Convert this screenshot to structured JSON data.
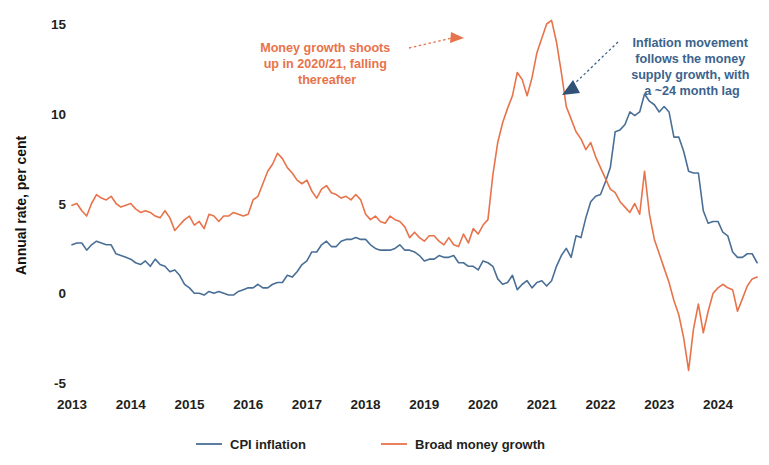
{
  "chart_data": {
    "type": "line",
    "title": "",
    "xlabel": "",
    "ylabel": "Annual rate, per cent",
    "ylim": [
      -5,
      15
    ],
    "xlim": [
      2013.0,
      2024.75
    ],
    "yticks": [
      -5,
      0,
      5,
      10,
      15
    ],
    "ytick_labels": [
      "-5",
      "0",
      "5",
      "10",
      "15"
    ],
    "xticks": [
      2013,
      2014,
      2015,
      2016,
      2017,
      2018,
      2019,
      2020,
      2021,
      2022,
      2023,
      2024
    ],
    "xtick_labels": [
      "2013",
      "2014",
      "2015",
      "2016",
      "2017",
      "2018",
      "2019",
      "2020",
      "2021",
      "2022",
      "2023",
      "2024"
    ],
    "grid": false,
    "legend_position": "bottom",
    "series": [
      {
        "name": "CPI inflation",
        "color": "#4a6f96",
        "x": [
          2013.0,
          2013.083,
          2013.167,
          2013.25,
          2013.333,
          2013.417,
          2013.5,
          2013.583,
          2013.667,
          2013.75,
          2013.833,
          2013.917,
          2014.0,
          2014.083,
          2014.167,
          2014.25,
          2014.333,
          2014.417,
          2014.5,
          2014.583,
          2014.667,
          2014.75,
          2014.833,
          2014.917,
          2015.0,
          2015.083,
          2015.167,
          2015.25,
          2015.333,
          2015.417,
          2015.5,
          2015.583,
          2015.667,
          2015.75,
          2015.833,
          2015.917,
          2016.0,
          2016.083,
          2016.167,
          2016.25,
          2016.333,
          2016.417,
          2016.5,
          2016.583,
          2016.667,
          2016.75,
          2016.833,
          2016.917,
          2017.0,
          2017.083,
          2017.167,
          2017.25,
          2017.333,
          2017.417,
          2017.5,
          2017.583,
          2017.667,
          2017.75,
          2017.833,
          2017.917,
          2018.0,
          2018.083,
          2018.167,
          2018.25,
          2018.333,
          2018.417,
          2018.5,
          2018.583,
          2018.667,
          2018.75,
          2018.833,
          2018.917,
          2019.0,
          2019.083,
          2019.167,
          2019.25,
          2019.333,
          2019.417,
          2019.5,
          2019.583,
          2019.667,
          2019.75,
          2019.833,
          2019.917,
          2020.0,
          2020.083,
          2020.167,
          2020.25,
          2020.333,
          2020.417,
          2020.5,
          2020.583,
          2020.667,
          2020.75,
          2020.833,
          2020.917,
          2021.0,
          2021.083,
          2021.167,
          2021.25,
          2021.333,
          2021.417,
          2021.5,
          2021.583,
          2021.667,
          2021.75,
          2021.833,
          2021.917,
          2022.0,
          2022.083,
          2022.167,
          2022.25,
          2022.333,
          2022.417,
          2022.5,
          2022.583,
          2022.667,
          2022.75,
          2022.833,
          2022.917,
          2023.0,
          2023.083,
          2023.167,
          2023.25,
          2023.333,
          2023.417,
          2023.5,
          2023.583,
          2023.667,
          2023.75,
          2023.833,
          2023.917,
          2024.0,
          2024.083,
          2024.167,
          2024.25,
          2024.333,
          2024.417,
          2024.5,
          2024.583,
          2024.667
        ],
        "values": [
          2.7,
          2.8,
          2.8,
          2.4,
          2.7,
          2.9,
          2.8,
          2.7,
          2.7,
          2.2,
          2.1,
          2.0,
          1.9,
          1.7,
          1.6,
          1.8,
          1.5,
          1.9,
          1.6,
          1.5,
          1.2,
          1.3,
          1.0,
          0.5,
          0.3,
          0.0,
          0.0,
          -0.1,
          0.1,
          0.0,
          0.1,
          0.0,
          -0.1,
          -0.1,
          0.1,
          0.2,
          0.3,
          0.3,
          0.5,
          0.3,
          0.3,
          0.5,
          0.6,
          0.6,
          1.0,
          0.9,
          1.2,
          1.6,
          1.8,
          2.3,
          2.3,
          2.7,
          2.9,
          2.6,
          2.6,
          2.9,
          3.0,
          3.0,
          3.1,
          3.0,
          3.0,
          2.7,
          2.5,
          2.4,
          2.4,
          2.4,
          2.5,
          2.7,
          2.4,
          2.4,
          2.3,
          2.1,
          1.8,
          1.9,
          1.9,
          2.1,
          2.0,
          2.0,
          2.1,
          1.7,
          1.7,
          1.5,
          1.5,
          1.3,
          1.8,
          1.7,
          1.5,
          0.8,
          0.5,
          0.6,
          1.0,
          0.2,
          0.5,
          0.7,
          0.3,
          0.6,
          0.7,
          0.4,
          0.7,
          1.5,
          2.1,
          2.5,
          2.0,
          3.2,
          3.1,
          4.2,
          5.1,
          5.4,
          5.5,
          6.2,
          7.0,
          9.0,
          9.1,
          9.4,
          10.1,
          9.9,
          10.1,
          11.1,
          10.7,
          10.5,
          10.1,
          10.4,
          10.1,
          8.7,
          8.7,
          7.9,
          6.8,
          6.7,
          6.7,
          4.6,
          3.9,
          4.0,
          4.0,
          3.4,
          3.2,
          2.3,
          2.0,
          2.0,
          2.2,
          2.2,
          1.7
        ]
      },
      {
        "name": "Broad money growth",
        "color": "#e8734a",
        "x": [
          2013.0,
          2013.083,
          2013.167,
          2013.25,
          2013.333,
          2013.417,
          2013.5,
          2013.583,
          2013.667,
          2013.75,
          2013.833,
          2013.917,
          2014.0,
          2014.083,
          2014.167,
          2014.25,
          2014.333,
          2014.417,
          2014.5,
          2014.583,
          2014.667,
          2014.75,
          2014.833,
          2014.917,
          2015.0,
          2015.083,
          2015.167,
          2015.25,
          2015.333,
          2015.417,
          2015.5,
          2015.583,
          2015.667,
          2015.75,
          2015.833,
          2015.917,
          2016.0,
          2016.083,
          2016.167,
          2016.25,
          2016.333,
          2016.417,
          2016.5,
          2016.583,
          2016.667,
          2016.75,
          2016.833,
          2016.917,
          2017.0,
          2017.083,
          2017.167,
          2017.25,
          2017.333,
          2017.417,
          2017.5,
          2017.583,
          2017.667,
          2017.75,
          2017.833,
          2017.917,
          2018.0,
          2018.083,
          2018.167,
          2018.25,
          2018.333,
          2018.417,
          2018.5,
          2018.583,
          2018.667,
          2018.75,
          2018.833,
          2018.917,
          2019.0,
          2019.083,
          2019.167,
          2019.25,
          2019.333,
          2019.417,
          2019.5,
          2019.583,
          2019.667,
          2019.75,
          2019.833,
          2019.917,
          2020.0,
          2020.083,
          2020.167,
          2020.25,
          2020.333,
          2020.417,
          2020.5,
          2020.583,
          2020.667,
          2020.75,
          2020.833,
          2020.917,
          2021.0,
          2021.083,
          2021.167,
          2021.25,
          2021.333,
          2021.417,
          2021.5,
          2021.583,
          2021.667,
          2021.75,
          2021.833,
          2021.917,
          2022.0,
          2022.083,
          2022.167,
          2022.25,
          2022.333,
          2022.417,
          2022.5,
          2022.583,
          2022.667,
          2022.75,
          2022.833,
          2022.917,
          2023.0,
          2023.083,
          2023.167,
          2023.25,
          2023.333,
          2023.417,
          2023.5,
          2023.583,
          2023.667,
          2023.75,
          2023.833,
          2023.917,
          2024.0,
          2024.083,
          2024.167,
          2024.25,
          2024.333,
          2024.417,
          2024.5,
          2024.583,
          2024.667
        ],
        "values": [
          4.9,
          5.0,
          4.6,
          4.3,
          5.0,
          5.5,
          5.3,
          5.2,
          5.4,
          5.0,
          4.8,
          4.9,
          5.0,
          4.7,
          4.5,
          4.6,
          4.5,
          4.3,
          4.2,
          4.6,
          4.2,
          3.5,
          3.8,
          4.1,
          4.3,
          3.8,
          4.0,
          3.6,
          4.4,
          4.3,
          4.0,
          4.3,
          4.3,
          4.5,
          4.4,
          4.3,
          4.4,
          5.2,
          5.4,
          6.1,
          6.8,
          7.2,
          7.8,
          7.5,
          7.0,
          6.7,
          6.3,
          6.1,
          6.3,
          5.7,
          5.3,
          5.8,
          6.0,
          5.6,
          5.5,
          5.3,
          5.4,
          5.2,
          5.5,
          5.2,
          4.4,
          4.1,
          4.3,
          4.0,
          3.9,
          4.3,
          4.1,
          4.0,
          3.7,
          3.1,
          3.4,
          3.1,
          2.9,
          3.2,
          3.2,
          2.9,
          2.7,
          3.1,
          2.7,
          2.6,
          3.3,
          2.8,
          3.6,
          3.3,
          3.8,
          4.1,
          6.6,
          8.4,
          9.5,
          10.3,
          11.0,
          12.3,
          11.9,
          11.0,
          12.0,
          13.4,
          14.2,
          15.0,
          15.2,
          14.0,
          12.3,
          10.4,
          9.7,
          9.0,
          8.6,
          8.0,
          8.4,
          7.6,
          7.0,
          6.4,
          5.8,
          5.6,
          5.1,
          4.8,
          4.5,
          5.0,
          4.4,
          6.8,
          4.4,
          3.0,
          2.2,
          1.4,
          0.6,
          -0.4,
          -1.2,
          -2.5,
          -4.3,
          -2.0,
          -0.6,
          -2.2,
          -1.0,
          0.0,
          0.3,
          0.5,
          0.3,
          0.2,
          -1.0,
          -0.3,
          0.4,
          0.8,
          0.9
        ]
      }
    ],
    "annotations": [
      {
        "id": "money-growth-annotation",
        "lines": [
          "Money growth shoots",
          "up in 2020/21, falling",
          "thereafter"
        ],
        "color": "#e8734a",
        "arrow": "dotted-arrow-right"
      },
      {
        "id": "inflation-annotation",
        "lines": [
          "Inflation movement",
          "follows the money",
          "supply growth, with",
          "a ~24 month lag"
        ],
        "color": "#3c638e",
        "arrow": "dotted-arrow-left-down"
      }
    ]
  },
  "legend": {
    "items": [
      {
        "label": "CPI inflation",
        "color": "#4a6f96"
      },
      {
        "label": "Broad money growth",
        "color": "#e8734a"
      }
    ]
  },
  "axis": {
    "ylabel": "Annual rate, per cent"
  }
}
